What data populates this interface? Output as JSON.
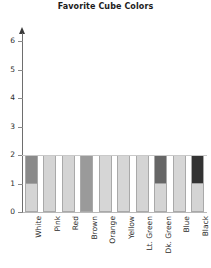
{
  "chart_data": {
    "type": "bar",
    "title": "Favorite Cube Colors",
    "xlabel": "",
    "ylabel": "",
    "categories": [
      "White",
      "Pink",
      "Red",
      "Brown",
      "Orange",
      "Yellow",
      "Lt. Green",
      "Dk. Green",
      "Blue",
      "Black"
    ],
    "values": [
      2,
      2,
      2,
      2,
      2,
      2,
      2,
      2,
      2,
      2
    ],
    "ylim": [
      0,
      6
    ],
    "yticks": [
      0,
      1,
      2,
      3,
      4,
      5,
      6
    ],
    "ytick_labels": [
      "0",
      "1",
      "2",
      "3",
      "4",
      "5",
      "6"
    ],
    "grid": false,
    "legend": "none",
    "stacked": true,
    "segments": [
      {
        "category": "White",
        "parts": [
          {
            "from": 0,
            "to": 1,
            "fill": "#d4d4d4"
          },
          {
            "from": 1,
            "to": 2,
            "fill": "#8a8a8a"
          }
        ]
      },
      {
        "category": "Pink",
        "parts": [
          {
            "from": 0,
            "to": 2,
            "fill": "#d4d4d4"
          }
        ]
      },
      {
        "category": "Red",
        "parts": [
          {
            "from": 0,
            "to": 2,
            "fill": "#d4d4d4"
          }
        ]
      },
      {
        "category": "Brown",
        "parts": [
          {
            "from": 0,
            "to": 2,
            "fill": "#9a9a9a"
          }
        ]
      },
      {
        "category": "Orange",
        "parts": [
          {
            "from": 0,
            "to": 2,
            "fill": "#d6d6d6"
          }
        ]
      },
      {
        "category": "Yellow",
        "parts": [
          {
            "from": 0,
            "to": 2,
            "fill": "#d6d6d6"
          }
        ]
      },
      {
        "category": "Lt. Green",
        "parts": [
          {
            "from": 0,
            "to": 2,
            "fill": "#d4d4d4"
          }
        ]
      },
      {
        "category": "Dk. Green",
        "parts": [
          {
            "from": 0,
            "to": 1,
            "fill": "#d4d4d4"
          },
          {
            "from": 1,
            "to": 2,
            "fill": "#666666"
          }
        ]
      },
      {
        "category": "Blue",
        "parts": [
          {
            "from": 0,
            "to": 2,
            "fill": "#d6d6d6"
          }
        ]
      },
      {
        "category": "Black",
        "parts": [
          {
            "from": 0,
            "to": 1,
            "fill": "#d4d4d4"
          },
          {
            "from": 1,
            "to": 2,
            "fill": "#333333"
          }
        ]
      }
    ],
    "colors": {
      "light_gray": "#d4d4d4",
      "medium_gray": "#9a9a9a",
      "dark_gray_white_bar": "#8a8a8a",
      "dark_gray_green_bar": "#666666",
      "near_black": "#333333",
      "bar_outline": "#a9a9a9",
      "axis": "#6e6e6e",
      "text": "#2b2b2b"
    }
  }
}
